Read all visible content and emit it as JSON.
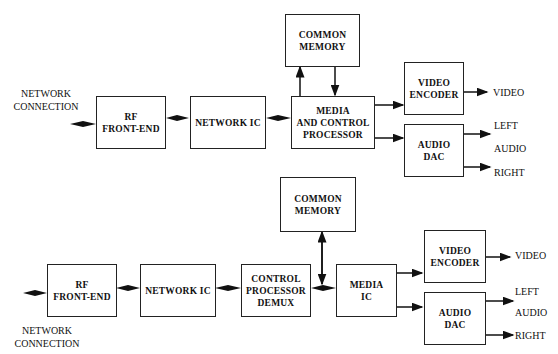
{
  "diagram_top": {
    "network_connection_label": "NETWORK\nCONNECTION",
    "rf_front_end": "RF\nFRONT-END",
    "network_ic": "NETWORK IC",
    "common_memory": "COMMON\nMEMORY",
    "media_control_processor": "MEDIA\nAND CONTROL\nPROCESSOR",
    "video_encoder": "VIDEO\nENCODER",
    "audio_dac": "AUDIO\nDAC",
    "video_out": "VIDEO",
    "left_out": "LEFT",
    "audio_label": "AUDIO",
    "right_out": "RIGHT"
  },
  "diagram_bottom": {
    "network_connection_label": "NETWORK\nCONNECTION",
    "rf_front_end": "RF\nFRONT-END",
    "network_ic": "NETWORK IC",
    "control_processor_demux": "CONTROL\nPROCESSOR\nDEMUX",
    "common_memory": "COMMON\nMEMORY",
    "media_ic": "MEDIA\nIC",
    "video_encoder": "VIDEO\nENCODER",
    "audio_dac": "AUDIO\nDAC",
    "video_out": "VIDEO",
    "left_out": "LEFT",
    "audio_label": "AUDIO",
    "right_out": "RIGHT"
  }
}
